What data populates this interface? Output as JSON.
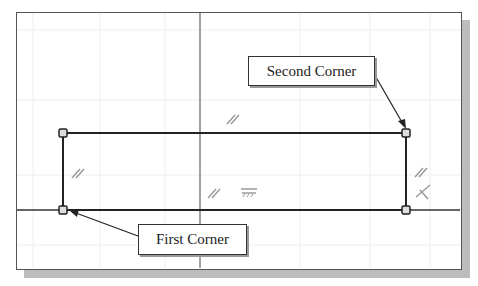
{
  "sketch": {
    "callouts": {
      "second_corner": "Second Corner",
      "first_corner": "First Corner"
    },
    "constraint_icons": [
      "parallel-icon",
      "parallel-icon",
      "parallel-icon",
      "parallel-icon",
      "horizontal-dimension-icon",
      "perpendicular-icon"
    ],
    "colors": {
      "line": "#222222",
      "axis": "#444444",
      "grid": "#ececec",
      "constraint": "#9a9a9a",
      "shadow": "#bdbdbd"
    }
  }
}
